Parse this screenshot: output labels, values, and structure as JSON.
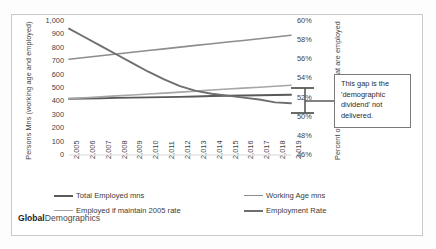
{
  "branding": {
    "bold": "Global",
    "normal": "Demographics"
  },
  "callout": {
    "text": "This gap is the 'demographic dividend' not delivered."
  },
  "chart_data": {
    "type": "line",
    "title": "",
    "subtitle": "",
    "xlabel": "",
    "ylabel": "Persons Mns (working age and employed)",
    "y2label": "Percent of Working Age that are employed",
    "grid": false,
    "legend_position": "bottom",
    "x": [
      2005,
      2006,
      2007,
      2008,
      2009,
      2010,
      2011,
      2012,
      2013,
      2014,
      2015,
      2016,
      2017,
      2018,
      2019
    ],
    "xticklabels": [
      "2,005",
      "2,006",
      "2,007",
      "2,008",
      "2,009",
      "2,010",
      "2,011",
      "2,012",
      "2,013",
      "2,014",
      "2,015",
      "2,016",
      "2,017",
      "2,018",
      "2,019"
    ],
    "ylim": [
      0,
      1000
    ],
    "yticks": [
      0,
      100,
      200,
      300,
      400,
      500,
      600,
      700,
      800,
      900,
      1000
    ],
    "yticklabels": [
      "0",
      "100",
      "200",
      "300",
      "400",
      "500",
      "600",
      "700",
      "800",
      "900",
      "1,000"
    ],
    "y2lim": [
      46,
      60
    ],
    "y2ticks": [
      46,
      48,
      50,
      52,
      54,
      56,
      58,
      60
    ],
    "y2ticklabels": [
      "46%",
      "48%",
      "50%",
      "52%",
      "54%",
      "56%",
      "58%",
      "60%"
    ],
    "series": [
      {
        "name": "Total Employed mns",
        "axis": "left",
        "color": "#595959",
        "width": 1.9,
        "values": [
          420,
          422,
          424,
          426,
          428,
          430,
          432,
          434,
          437,
          440,
          442,
          444,
          446,
          448,
          450
        ]
      },
      {
        "name": "Working Age mns",
        "axis": "left",
        "color": "#8d8d8d",
        "width": 1.6,
        "values": [
          715,
          728,
          741,
          754,
          767,
          780,
          792,
          805,
          818,
          830,
          843,
          855,
          868,
          881,
          894
        ]
      },
      {
        "name": "Employed if maintain 2005 rate",
        "axis": "left",
        "color": "#a6a6a6",
        "width": 1.6,
        "values": [
          420,
          427,
          434,
          441,
          448,
          455,
          462,
          469,
          477,
          485,
          492,
          499,
          506,
          513,
          520
        ]
      },
      {
        "name": "Employment Rate",
        "axis": "right",
        "color": "#6e6e6e",
        "width": 1.9,
        "values": [
          59.2,
          58.3,
          57.4,
          56.5,
          55.6,
          54.7,
          53.9,
          53.2,
          52.7,
          52.4,
          52.2,
          52.0,
          51.8,
          51.5,
          51.4
        ]
      }
    ],
    "legend": [
      {
        "label": "Total Employed mns",
        "color": "#595959"
      },
      {
        "label": "Working Age mns",
        "color": "#8d8d8d"
      },
      {
        "label": "Employed if maintain 2005 rate",
        "color": "#a6a6a6"
      },
      {
        "label": "Employment Rate",
        "color": "#6e6e6e"
      }
    ],
    "annotations": [
      {
        "name": "demographic-dividend-gap",
        "text": "This gap is the 'demographic dividend' not delivered."
      }
    ]
  }
}
